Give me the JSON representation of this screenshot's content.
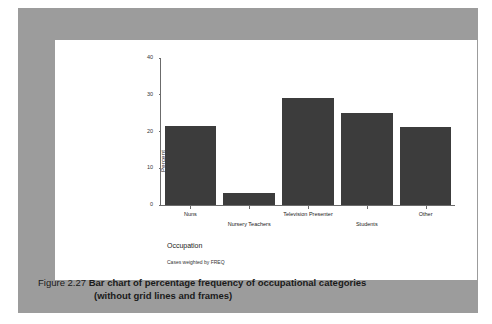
{
  "caption": {
    "figure_number": "Figure 2.27",
    "line1": "Bar chart of percentage frequency of occupational categories",
    "line2": "(without grid lines and frames)"
  },
  "colors": {
    "bar": "#3c3c3c",
    "panel": "#9c9c9c",
    "card": "#ffffff",
    "axis": "#6b6b6b"
  },
  "chart_data": {
    "type": "bar",
    "title": "",
    "xlabel": "Occupation",
    "ylabel": "Percent",
    "ylim": [
      0,
      40
    ],
    "yticks": [
      "0",
      "10",
      "20",
      "30",
      "40"
    ],
    "ytick_values": [
      0,
      10,
      20,
      30,
      40
    ],
    "grid": false,
    "frame": false,
    "legend": "none",
    "footnote": "Cases weighted by FREQ",
    "categories": [
      "Nuns",
      "Nursery Teachers",
      "Television Presenter",
      "Students",
      "Other"
    ],
    "values": [
      21.4,
      3.2,
      29.0,
      25.0,
      21.2
    ],
    "label_rows": [
      0,
      1,
      0,
      1,
      0
    ]
  }
}
